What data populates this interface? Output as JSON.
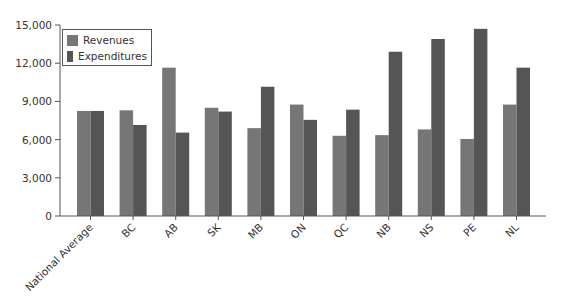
{
  "chart_data": {
    "type": "bar",
    "title": "",
    "xlabel": "",
    "ylabel": "",
    "ylim": [
      0,
      15000
    ],
    "yticks": [
      0,
      3000,
      6000,
      9000,
      12000,
      15000
    ],
    "ytick_labels": [
      "0",
      "3,000",
      "6,000",
      "9,000",
      "12,000",
      "15,000"
    ],
    "categories": [
      "National Average",
      "BC",
      "AB",
      "SK",
      "MB",
      "ON",
      "QC",
      "NB",
      "NS",
      "PE",
      "NL"
    ],
    "series": [
      {
        "name": "Revenues",
        "color": "#767676",
        "values": [
          8250,
          8300,
          11650,
          8500,
          6900,
          8750,
          6300,
          6350,
          6800,
          6050,
          8750
        ]
      },
      {
        "name": "Expenditures",
        "color": "#555555",
        "values": [
          8250,
          7150,
          6550,
          8200,
          10150,
          7550,
          8350,
          12900,
          13900,
          14700,
          11650
        ]
      }
    ],
    "legend_position": "top-left",
    "grid": false
  },
  "legend": {
    "items": [
      {
        "label": "Revenues",
        "color": "#767676"
      },
      {
        "label": "Expenditures",
        "color": "#555555"
      }
    ]
  }
}
